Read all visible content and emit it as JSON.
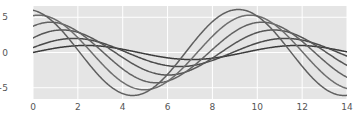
{
  "chart_data": {
    "type": "line",
    "title": "",
    "xlabel": "",
    "ylabel": "",
    "xlim": [
      0,
      14
    ],
    "ylim": [
      -6.6,
      6.6
    ],
    "xticks": [
      0,
      2,
      4,
      6,
      8,
      10,
      12,
      14
    ],
    "yticks": [
      -5,
      0,
      5
    ],
    "xtick_labels": [
      "0",
      "2",
      "4",
      "6",
      "8",
      "10",
      "12",
      "14"
    ],
    "ytick_labels": [
      "−5",
      "0",
      "5"
    ],
    "grid": true,
    "grid_color": "#ffffff",
    "axes_background": "#e5e5e5",
    "figure_background": "#ffffff",
    "legend": "none",
    "line_width": 1.5,
    "x_start": 0,
    "x_end": 14,
    "x_samples": 400,
    "series": [
      {
        "name": "wave-1",
        "amplitude": 1.0,
        "phase": 0.0,
        "frequency": 0.6667,
        "color": "#3b3b3b",
        "formula": "A*sin(0.6667*x + phase)"
      },
      {
        "name": "wave-2",
        "amplitude": 2.0,
        "phase": 0.35,
        "frequency": 0.6667,
        "color": "#4a4a4a",
        "formula": "A*sin(0.6667*x + phase)"
      },
      {
        "name": "wave-3",
        "amplitude": 3.2,
        "phase": 0.7,
        "frequency": 0.6667,
        "color": "#565656",
        "formula": "A*sin(0.6667*x + phase)"
      },
      {
        "name": "wave-4",
        "amplitude": 4.3,
        "phase": 1.05,
        "frequency": 0.6667,
        "color": "#626262",
        "formula": "A*sin(0.6667*x + phase)"
      },
      {
        "name": "wave-5",
        "amplitude": 5.3,
        "phase": 1.4,
        "frequency": 0.6667,
        "color": "#6e6e6e",
        "formula": "A*sin(0.6667*x + phase)"
      },
      {
        "name": "wave-6",
        "amplitude": 6.1,
        "phase": 1.75,
        "frequency": 0.6667,
        "color": "#5f5f5f",
        "formula": "A*sin(0.6667*x + phase)"
      }
    ]
  }
}
